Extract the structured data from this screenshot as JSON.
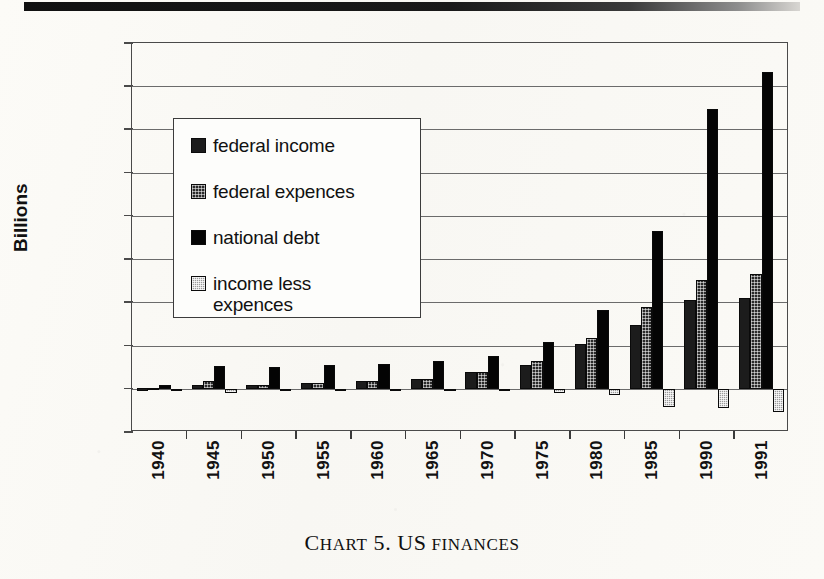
{
  "figure": {
    "caption_lead": "C",
    "caption_rest": "HART",
    "caption_number": " 5. US",
    "caption_tail": " FINANCES",
    "caption_full": "CHART 5. US FINANCES"
  },
  "legend": {
    "items": [
      {
        "label": "federal income",
        "swatch": "dark-hatched",
        "color": "#1c1c1c"
      },
      {
        "label": "federal expences",
        "swatch": "mid-hatched",
        "color": "#2a2a2a"
      },
      {
        "label": "national debt",
        "swatch": "solid-black",
        "color": "#040404"
      },
      {
        "label": "income less\nexpences",
        "swatch": "light-hatched",
        "color": "#9a9a9a"
      }
    ]
  },
  "chart_data": {
    "type": "bar",
    "title": "CHART 5. US FINANCES",
    "xlabel": "",
    "ylabel": "Billions",
    "ylim": [
      -500,
      4000
    ],
    "ytick_values": [
      4000,
      3500,
      3000,
      2500,
      2000,
      1500,
      1000,
      500,
      0,
      -500
    ],
    "ytick_labels": [
      "4000",
      "3500",
      "3000",
      "2500",
      "2000",
      "1500",
      "1000",
      "500",
      "0",
      "-500"
    ],
    "grid": true,
    "legend_position": "upper-left-inside",
    "categories": [
      "1940",
      "1945",
      "1950",
      "1955",
      "1960",
      "1965",
      "1970",
      "1975",
      "1980",
      "1985",
      "1990",
      "1991"
    ],
    "series": [
      {
        "name": "federal income",
        "values": [
          7,
          45,
          40,
          66,
          93,
          117,
          193,
          280,
          517,
          734,
          1032,
          1055
        ]
      },
      {
        "name": "federal expences",
        "values": [
          9,
          93,
          43,
          68,
          92,
          118,
          196,
          326,
          591,
          946,
          1253,
          1323
        ]
      },
      {
        "name": "national debt",
        "values": [
          43,
          259,
          257,
          274,
          291,
          322,
          381,
          542,
          909,
          1823,
          3233,
          3665
        ]
      },
      {
        "name": "income less expences",
        "values": [
          -3,
          -48,
          -3,
          -3,
          1,
          -1,
          -3,
          -46,
          -74,
          -212,
          -221,
          -268
        ]
      }
    ]
  }
}
